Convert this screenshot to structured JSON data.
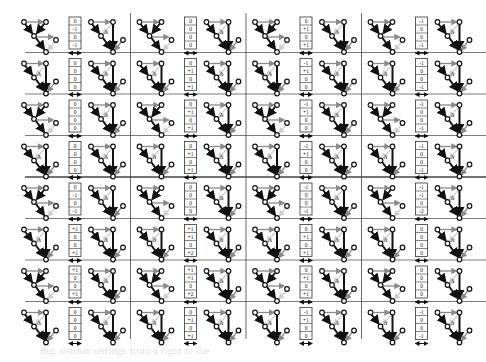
{
  "figure": {
    "rows": 8,
    "groups": 4,
    "delta_label": "Δ",
    "divider_after_row": 4,
    "colors": {
      "ink": "#111111",
      "gray_arrow": "#8a8a8a",
      "light_arrow": "#cfcfcf",
      "rule": "#444444"
    },
    "tables": [
      [
        [
          "0",
          "-1",
          "0",
          "-1"
        ],
        [
          "0",
          "0",
          "0",
          "0"
        ],
        [
          "0",
          "+1",
          "0",
          "+1"
        ],
        [
          "-1",
          "0",
          "0",
          "-1"
        ]
      ],
      [
        [
          "0",
          "0",
          "0",
          "0"
        ],
        [
          "0",
          "+1",
          "0",
          "+1"
        ],
        [
          "-1",
          "+1",
          "0",
          "0"
        ],
        [
          "-1",
          "0",
          "0",
          "-1"
        ]
      ],
      [
        [
          "0",
          "0",
          "0",
          "0"
        ],
        [
          "0",
          "+1",
          "0",
          "+1"
        ],
        [
          "-1",
          "+1",
          "0",
          "0"
        ],
        [
          "-1",
          "0",
          "0",
          "-1"
        ]
      ],
      [
        [
          "0",
          "0",
          "0",
          "0"
        ],
        [
          "0",
          "+1",
          "0",
          "+1"
        ],
        [
          "-1",
          "+1",
          "0",
          "0"
        ],
        [
          "-1",
          "0",
          "0",
          "-1"
        ]
      ],
      [
        [
          "0",
          "-1",
          "0",
          "-1"
        ],
        [
          "0",
          "0",
          "0",
          "0"
        ],
        [
          "-1",
          "0",
          "0",
          "-1"
        ],
        [
          "-1",
          "-1",
          "0",
          "-2"
        ]
      ],
      [
        [
          "+1",
          "0",
          "0",
          "+1"
        ],
        [
          "+1",
          "+1",
          "0",
          "+2"
        ],
        [
          "0",
          "+1",
          "0",
          "+1"
        ],
        [
          "0",
          "0",
          "0",
          "0"
        ]
      ],
      [
        [
          "+1",
          "0",
          "0",
          "+1"
        ],
        [
          "+1",
          "+1",
          "0",
          "+2"
        ],
        [
          "0",
          "+1",
          "0",
          "+1"
        ],
        [
          "0",
          "0",
          "0",
          "0"
        ]
      ],
      [
        [
          "0",
          "0",
          "0",
          "0"
        ],
        [
          "0",
          "+1",
          "0",
          "+1"
        ],
        [
          "-1",
          "+1",
          "0",
          "0"
        ],
        [
          "-1",
          "0",
          "0",
          "-1"
        ]
      ]
    ],
    "ghost_text": "ing. similar settings from a right to the"
  }
}
